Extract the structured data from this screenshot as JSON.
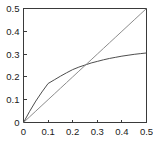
{
  "chart_data": {
    "type": "line",
    "title": "",
    "xlabel": "",
    "ylabel": "",
    "xlim": [
      0,
      0.5
    ],
    "ylim": [
      0,
      0.5
    ],
    "grid": false,
    "legend": "none",
    "xticks": [
      0,
      0.1,
      0.2,
      0.3,
      0.4,
      0.5
    ],
    "yticks": [
      0,
      0.1,
      0.2,
      0.3,
      0.4,
      0.5
    ],
    "xticklabels": [
      "0",
      "0.1",
      "0.2",
      "0.3",
      "0.4",
      "0.5"
    ],
    "yticklabels": [
      "0",
      "0.1",
      "0.2",
      "0.3",
      "0.4",
      "0.5"
    ],
    "x": [
      0,
      0.025,
      0.05,
      0.075,
      0.1,
      0.125,
      0.15,
      0.175,
      0.2,
      0.225,
      0.25,
      0.275,
      0.3,
      0.325,
      0.35,
      0.375,
      0.4,
      0.425,
      0.45,
      0.475,
      0.5
    ],
    "series": [
      {
        "name": "saturating-curve",
        "color": "#4d4d4d",
        "values": [
          0,
          0.049,
          0.094,
          0.134,
          0.171,
          0.187,
          0.203,
          0.218,
          0.232,
          0.243,
          0.252,
          0.261,
          0.268,
          0.275,
          0.281,
          0.286,
          0.291,
          0.295,
          0.299,
          0.302,
          0.305
        ]
      },
      {
        "name": "identity-line",
        "color": "#8c8c8c",
        "values": [
          0,
          0.025,
          0.05,
          0.075,
          0.1,
          0.125,
          0.15,
          0.175,
          0.2,
          0.225,
          0.25,
          0.275,
          0.3,
          0.325,
          0.35,
          0.375,
          0.4,
          0.425,
          0.45,
          0.475,
          0.5
        ]
      }
    ],
    "intersection": {
      "x": 0.25,
      "y": 0.25
    },
    "axis_color": "#3a3a3a",
    "background_color": "#ffffff"
  }
}
